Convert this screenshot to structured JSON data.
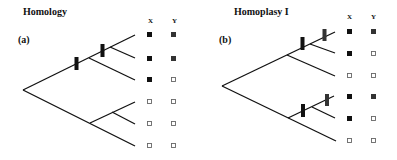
{
  "panels": [
    {
      "id": "a",
      "title": "Homology",
      "label": "(a)",
      "columns": [
        "X",
        "Y"
      ],
      "taxa_states": [
        {
          "X": "filled",
          "Y": "filled"
        },
        {
          "X": "filled",
          "Y": "filled"
        },
        {
          "X": "filled",
          "Y": "open"
        },
        {
          "X": "open",
          "Y": "open"
        },
        {
          "X": "open",
          "Y": "open"
        },
        {
          "X": "open",
          "Y": "open"
        }
      ],
      "change_marks": 2
    },
    {
      "id": "b",
      "title": "Homoplasy I",
      "label": "(b)",
      "columns": [
        "X",
        "Y"
      ],
      "taxa_states": [
        {
          "X": "filled",
          "Y": "filled"
        },
        {
          "X": "filled",
          "Y": "open"
        },
        {
          "X": "open",
          "Y": "open"
        },
        {
          "X": "filled",
          "Y": "filled"
        },
        {
          "X": "filled",
          "Y": "open"
        },
        {
          "X": "open",
          "Y": "open"
        }
      ],
      "change_marks": 4
    }
  ],
  "colors": {
    "line": "#111111",
    "filled": "#111111",
    "filled_y": "#333333",
    "open_stroke": "#666666",
    "mark": "#111111"
  }
}
